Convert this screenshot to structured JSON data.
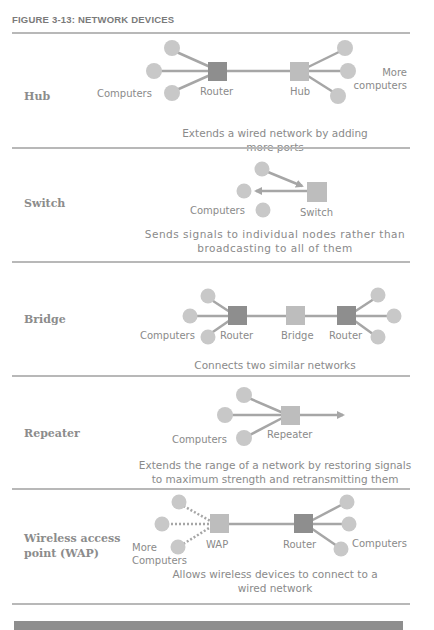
{
  "figure_title": "FIGURE 3-13: NETWORK DEVICES",
  "colors": {
    "computer": "#c8c8c8",
    "router": "#8e8e8e",
    "device_light": "#bdbdbd",
    "line": "#a6a6a6",
    "rule": "#b8b8b8",
    "text": "#8a8a8a"
  },
  "rows": [
    {
      "label": "Hub",
      "node_labels": {
        "computers": "Computers",
        "router": "Router",
        "device": "Hub",
        "more": "More computers",
        "more_line1": "More",
        "more_line2": "computers"
      },
      "description_lines": [
        "Extends a wired network by adding",
        "more ports"
      ]
    },
    {
      "label": "Switch",
      "node_labels": {
        "computers": "Computers",
        "device": "Switch"
      },
      "description_lines": [
        "Sends signals to individual nodes rather than",
        "broadcasting to all of them"
      ]
    },
    {
      "label": "Bridge",
      "node_labels": {
        "computers": "Computers",
        "router_left": "Router",
        "device": "Bridge",
        "router_right": "Router"
      },
      "description_lines": [
        "Connects two similar networks"
      ]
    },
    {
      "label": "Repeater",
      "node_labels": {
        "computers": "Computers",
        "device": "Repeater"
      },
      "description_lines": [
        "Extends the range of a network by restoring signals",
        "to maximum strength and retransmitting them"
      ]
    },
    {
      "label_lines": [
        "Wireless access",
        "point (WAP)"
      ],
      "node_labels": {
        "more_line1": "More",
        "more_line2": "Computers",
        "device": "WAP",
        "router": "Router",
        "computers": "Computers"
      },
      "description_lines": [
        "Allows wireless devices to connect to a",
        "wired network"
      ]
    }
  ]
}
